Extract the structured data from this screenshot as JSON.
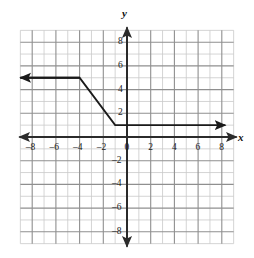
{
  "figure": {
    "background_color": "#ffffff",
    "grid_color": "#c9c9c9",
    "major_grid_color": "#8f8f8f",
    "axis_color": "#2b2b2b",
    "curve_color": "#1a1a1a",
    "label_color": "#1a1a1a"
  },
  "axis_names": {
    "x": "x",
    "y": "y"
  },
  "chart_data": {
    "type": "line",
    "title": "",
    "xlabel": "x",
    "ylabel": "y",
    "grid": true,
    "legend": "none",
    "xlim": [
      -9,
      9
    ],
    "ylim": [
      -9,
      9
    ],
    "x_ticks": [
      -8,
      -6,
      -4,
      -2,
      0,
      2,
      4,
      6,
      8
    ],
    "y_ticks": [
      8,
      6,
      4,
      2,
      -2,
      -4,
      -6,
      -8
    ],
    "x_tick_labels": [
      "–8",
      "–6",
      "–4",
      "–2",
      "0",
      "2",
      "4",
      "6",
      "8"
    ],
    "y_tick_labels": [
      "8",
      "6",
      "4",
      "2",
      "–2",
      "–4",
      "–6",
      "–8"
    ],
    "minor_tick_step": 1,
    "major_tick_step": 2,
    "series": [
      {
        "name": "piecewise-function",
        "description": "piecewise linear: constant y=5 for x<=-4, decreasing segment from (-4,5) to (-1,1), constant y=1 for x>=-1",
        "arrow_start": true,
        "arrow_end": true,
        "points": [
          {
            "x": -9.0,
            "y": 5
          },
          {
            "x": -4.0,
            "y": 5
          },
          {
            "x": -1.0,
            "y": 1
          },
          {
            "x": 8.3,
            "y": 1
          }
        ]
      }
    ],
    "annotations": []
  }
}
